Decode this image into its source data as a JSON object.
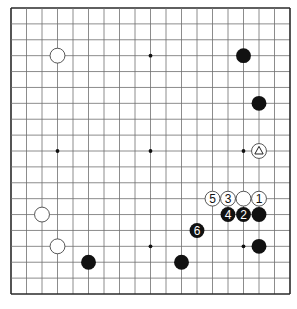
{
  "diagram": {
    "type": "go-board",
    "size": 19,
    "geometry": {
      "left": 11,
      "top": 8,
      "right": 290,
      "bottom": 294
    },
    "colors": {
      "background": "#ffffff",
      "grid_line": "#6e6e6e",
      "border": "#2a2a2a",
      "black_stone": "#111111",
      "white_stone": "#ffffff",
      "stone_outline": "#444444"
    },
    "star_points": [
      [
        3,
        3
      ],
      [
        9,
        3
      ],
      [
        15,
        3
      ],
      [
        3,
        9
      ],
      [
        9,
        9
      ],
      [
        15,
        9
      ],
      [
        3,
        15
      ],
      [
        9,
        15
      ],
      [
        15,
        15
      ]
    ],
    "stones": [
      {
        "color": "white",
        "col": 3,
        "row": 3,
        "label": ""
      },
      {
        "color": "black",
        "col": 15,
        "row": 3,
        "label": ""
      },
      {
        "color": "black",
        "col": 16,
        "row": 6,
        "label": ""
      },
      {
        "color": "white",
        "col": 16,
        "row": 9,
        "label": "",
        "mark": "triangle"
      },
      {
        "color": "white",
        "col": 13,
        "row": 12,
        "label": "5"
      },
      {
        "color": "white",
        "col": 14,
        "row": 12,
        "label": "3"
      },
      {
        "color": "white",
        "col": 15,
        "row": 12,
        "label": ""
      },
      {
        "color": "white",
        "col": 16,
        "row": 12,
        "label": "1"
      },
      {
        "color": "black",
        "col": 14,
        "row": 13,
        "label": "4"
      },
      {
        "color": "black",
        "col": 15,
        "row": 13,
        "label": "2"
      },
      {
        "color": "black",
        "col": 16,
        "row": 13,
        "label": ""
      },
      {
        "color": "white",
        "col": 2,
        "row": 13,
        "label": ""
      },
      {
        "color": "black",
        "col": 12,
        "row": 14,
        "label": "6"
      },
      {
        "color": "white",
        "col": 3,
        "row": 15,
        "label": ""
      },
      {
        "color": "black",
        "col": 16,
        "row": 15,
        "label": ""
      },
      {
        "color": "black",
        "col": 5,
        "row": 16,
        "label": ""
      },
      {
        "color": "black",
        "col": 11,
        "row": 16,
        "label": ""
      }
    ]
  },
  "caption": {
    "text": ""
  }
}
